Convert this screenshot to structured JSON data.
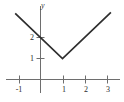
{
  "figure": {
    "title": "",
    "background_color": "#ffffff",
    "curve_color": "#2e2e2e",
    "axis_color": "#6e6e6e",
    "label_color": "#2b2b2b"
  },
  "axes": {
    "x_axis_name": "",
    "y_axis_name": "y",
    "x_ticks": [
      {
        "value": -1,
        "label": "-1"
      },
      {
        "value": 1,
        "label": "1"
      },
      {
        "value": 2,
        "label": "2"
      },
      {
        "value": 3,
        "label": "3"
      }
    ],
    "y_ticks": [
      {
        "value": 1,
        "label": "1"
      },
      {
        "value": 2,
        "label": "2"
      }
    ]
  },
  "chart_data": {
    "type": "line",
    "title": "",
    "xlabel": "",
    "ylabel": "y",
    "xlim": [
      -1.9,
      3.8
    ],
    "ylim": [
      -0.6,
      4.1
    ],
    "grid": false,
    "legend": null,
    "annotations": [],
    "series": [
      {
        "name": "y = |x - 1| + 1",
        "color": "#2e2e2e",
        "x": [
          -1.15,
          1,
          3.2
        ],
        "y": [
          3.15,
          1,
          3.2
        ],
        "vertex": {
          "x": 1,
          "y": 1
        },
        "y_intercept": {
          "x": 0,
          "y": 2
        }
      }
    ]
  }
}
